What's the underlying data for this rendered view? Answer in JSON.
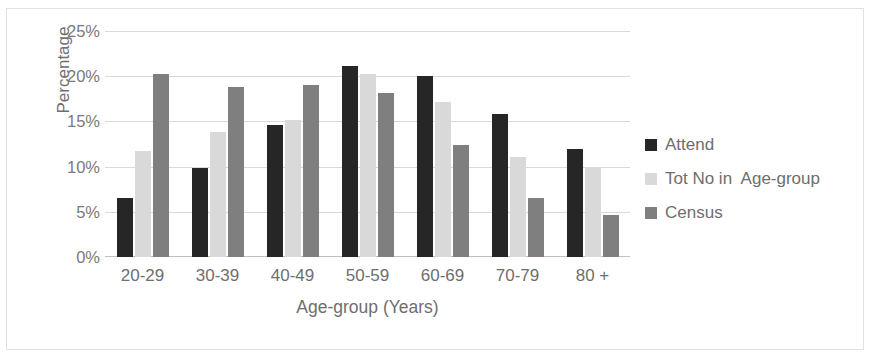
{
  "chart_data": {
    "type": "bar",
    "title": "",
    "xlabel": "Age-group (Years)",
    "ylabel": "Percentage",
    "categories": [
      "20-29",
      "30-39",
      "40-49",
      "50-59",
      "60-69",
      "70-79",
      "80 +"
    ],
    "series": [
      {
        "name": "Attend",
        "color": "#262626",
        "values": [
          6.5,
          9.8,
          14.6,
          21.1,
          20.0,
          15.8,
          11.9
        ]
      },
      {
        "name": "Tot No in  Age-group",
        "color": "#d9d9d9",
        "values": [
          11.7,
          13.8,
          15.2,
          20.3,
          17.2,
          11.1,
          9.9
        ]
      },
      {
        "name": "Census",
        "color": "#7f7f7f",
        "values": [
          20.2,
          18.8,
          19.0,
          18.1,
          12.4,
          6.5,
          4.6
        ]
      }
    ],
    "ylim": [
      0,
      25
    ],
    "y_ticks": [
      0,
      5,
      10,
      15,
      20,
      25
    ],
    "y_tick_labels": [
      "0%",
      "5%",
      "10%",
      "15%",
      "20%",
      "25%"
    ],
    "grid": true,
    "legend_position": "right",
    "value_suffix": "%"
  }
}
